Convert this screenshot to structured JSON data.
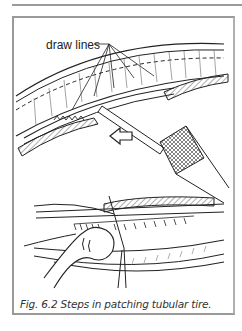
{
  "figure": {
    "label_text": "draw lines",
    "caption": "Fig. 6.2 Steps in patching tubular tire.",
    "illustrations": [
      {
        "name": "top-panel",
        "description": "tire casing with stitched patch, draw lines, arrow and awl tool"
      },
      {
        "name": "bottom-panel",
        "description": "hand pulling stitches with needle through tubular tire"
      }
    ]
  },
  "colors": {
    "frame": "#9a9a9a",
    "ink": "#222222",
    "caption": "#333333"
  }
}
